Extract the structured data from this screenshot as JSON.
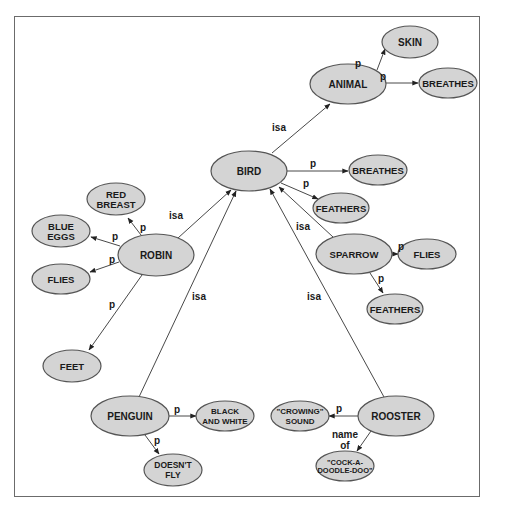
{
  "diagram": {
    "title": "",
    "type": "semantic-network",
    "colors": {
      "node_fill": "#d4d4d4",
      "node_stroke": "#555555",
      "edge": "#333333",
      "frame": "#6b6b6b"
    },
    "nodes": [
      {
        "id": "animal",
        "lines": [
          "ANIMAL"
        ],
        "cx": 348,
        "cy": 84,
        "rx": 38,
        "ry": 20,
        "fs": 10
      },
      {
        "id": "skin",
        "lines": [
          "SKIN"
        ],
        "cx": 410,
        "cy": 42,
        "rx": 28,
        "ry": 16,
        "fs": 10
      },
      {
        "id": "animal-breathes",
        "lines": [
          "BREATHES"
        ],
        "cx": 448,
        "cy": 83,
        "rx": 29,
        "ry": 15,
        "fs": 9.5
      },
      {
        "id": "bird",
        "lines": [
          "BIRD"
        ],
        "cx": 249,
        "cy": 171,
        "rx": 38,
        "ry": 20,
        "fs": 10
      },
      {
        "id": "bird-breathes",
        "lines": [
          "BREATHES"
        ],
        "cx": 378,
        "cy": 170,
        "rx": 29,
        "ry": 15,
        "fs": 9.5
      },
      {
        "id": "bird-feathers",
        "lines": [
          "FEATHERS"
        ],
        "cx": 341,
        "cy": 208,
        "rx": 28,
        "ry": 15,
        "fs": 9.5
      },
      {
        "id": "red-breast",
        "lines": [
          "RED",
          "BREAST"
        ],
        "cx": 116,
        "cy": 199,
        "rx": 29,
        "ry": 16,
        "fs": 9.5
      },
      {
        "id": "blue-eggs",
        "lines": [
          "BLUE",
          "EGGS"
        ],
        "cx": 61,
        "cy": 231,
        "rx": 29,
        "ry": 16,
        "fs": 9.5
      },
      {
        "id": "robin",
        "lines": [
          "ROBIN"
        ],
        "cx": 156,
        "cy": 255,
        "rx": 38,
        "ry": 21,
        "fs": 10
      },
      {
        "id": "robin-flies",
        "lines": [
          "FLIES"
        ],
        "cx": 61,
        "cy": 279,
        "rx": 29,
        "ry": 15,
        "fs": 9.5
      },
      {
        "id": "feet",
        "lines": [
          "FEET"
        ],
        "cx": 72,
        "cy": 366,
        "rx": 29,
        "ry": 16,
        "fs": 9.5
      },
      {
        "id": "sparrow",
        "lines": [
          "SPARROW"
        ],
        "cx": 354,
        "cy": 254,
        "rx": 38,
        "ry": 20,
        "fs": 9.5
      },
      {
        "id": "sparrow-flies",
        "lines": [
          "FLIES"
        ],
        "cx": 427,
        "cy": 254,
        "rx": 29,
        "ry": 15,
        "fs": 9.5
      },
      {
        "id": "sparrow-feathers",
        "lines": [
          "FEATHERS"
        ],
        "cx": 395,
        "cy": 309,
        "rx": 28,
        "ry": 15,
        "fs": 9.5
      },
      {
        "id": "penguin",
        "lines": [
          "PENGUIN"
        ],
        "cx": 130,
        "cy": 416,
        "rx": 39,
        "ry": 20,
        "fs": 10
      },
      {
        "id": "black-and-white",
        "lines": [
          "BLACK",
          "AND WHITE"
        ],
        "cx": 225,
        "cy": 416,
        "rx": 29,
        "ry": 15,
        "fs": 8
      },
      {
        "id": "doesnt-fly",
        "lines": [
          "DOESN'T",
          "FLY"
        ],
        "cx": 173,
        "cy": 470,
        "rx": 29,
        "ry": 16,
        "fs": 8.5
      },
      {
        "id": "rooster",
        "lines": [
          "ROOSTER"
        ],
        "cx": 396,
        "cy": 416,
        "rx": 38,
        "ry": 20,
        "fs": 10
      },
      {
        "id": "crowing-sound",
        "lines": [
          "\"CROWING\"",
          "SOUND"
        ],
        "cx": 300,
        "cy": 416,
        "rx": 29,
        "ry": 15,
        "fs": 8
      },
      {
        "id": "cock-a-doodle-doo",
        "lines": [
          "\"COCK-A-",
          "DOODLE-DOO\""
        ],
        "cx": 345,
        "cy": 466,
        "rx": 29,
        "ry": 15,
        "fs": 7.5
      }
    ],
    "edges": [
      {
        "from": "bird",
        "to": "animal",
        "label": "isa",
        "x1": 272,
        "y1": 153,
        "x2": 330,
        "y2": 104,
        "lx": 279,
        "ly": 127
      },
      {
        "from": "animal",
        "to": "skin",
        "label": "p",
        "x1": 377,
        "y1": 70,
        "x2": 385,
        "y2": 49,
        "lx": 358,
        "ly": 63,
        "curve": false
      },
      {
        "from": "animal",
        "to": "animal-breathes",
        "label": "p",
        "x1": 386,
        "y1": 83,
        "x2": 418,
        "y2": 83,
        "lx": 383,
        "ly": 76
      },
      {
        "from": "bird",
        "to": "bird-breathes",
        "label": "p",
        "x1": 287,
        "y1": 171,
        "x2": 348,
        "y2": 171,
        "lx": 313,
        "ly": 163
      },
      {
        "from": "bird",
        "to": "bird-feathers",
        "label": "p",
        "x1": 281,
        "y1": 183,
        "x2": 318,
        "y2": 199,
        "lx": 306,
        "ly": 183
      },
      {
        "from": "robin",
        "to": "bird",
        "label": "isa",
        "x1": 178,
        "y1": 238,
        "x2": 231,
        "y2": 190,
        "lx": 176,
        "ly": 215
      },
      {
        "from": "robin",
        "to": "red-breast",
        "label": "p",
        "x1": 141,
        "y1": 235,
        "x2": 128,
        "y2": 218,
        "lx": 143,
        "ly": 227
      },
      {
        "from": "robin",
        "to": "blue-eggs",
        "label": "p",
        "x1": 120,
        "y1": 246,
        "x2": 91,
        "y2": 237,
        "lx": 115,
        "ly": 236
      },
      {
        "from": "robin",
        "to": "robin-flies",
        "label": "p",
        "x1": 119,
        "y1": 262,
        "x2": 90,
        "y2": 272,
        "lx": 112,
        "ly": 259
      },
      {
        "from": "robin",
        "to": "feet",
        "label": "p",
        "x1": 142,
        "y1": 275,
        "x2": 89,
        "y2": 350,
        "lx": 112,
        "ly": 304
      },
      {
        "from": "penguin",
        "to": "bird",
        "label": "isa",
        "x1": 139,
        "y1": 397,
        "x2": 236,
        "y2": 191,
        "lx": 199,
        "ly": 296
      },
      {
        "from": "penguin",
        "to": "black-and-white",
        "label": "p",
        "x1": 169,
        "y1": 416,
        "x2": 196,
        "y2": 416,
        "lx": 177,
        "ly": 409
      },
      {
        "from": "penguin",
        "to": "doesnt-fly",
        "label": "p",
        "x1": 145,
        "y1": 435,
        "x2": 159,
        "y2": 454,
        "lx": 157,
        "ly": 440
      },
      {
        "from": "sparrow",
        "to": "bird",
        "label": "isa",
        "x1": 333,
        "y1": 237,
        "x2": 279,
        "y2": 187,
        "lx": 303,
        "ly": 226
      },
      {
        "from": "sparrow",
        "to": "sparrow-flies",
        "label": "p",
        "x1": 392,
        "y1": 254,
        "x2": 398,
        "y2": 254,
        "lx": 401,
        "ly": 246
      },
      {
        "from": "sparrow",
        "to": "sparrow-feathers",
        "label": "p",
        "x1": 370,
        "y1": 273,
        "x2": 383,
        "y2": 293,
        "lx": 381,
        "ly": 278
      },
      {
        "from": "rooster",
        "to": "bird",
        "label": "isa",
        "x1": 384,
        "y1": 397,
        "x2": 270,
        "y2": 189,
        "lx": 314,
        "ly": 296
      },
      {
        "from": "rooster",
        "to": "crowing-sound",
        "label": "p",
        "x1": 358,
        "y1": 416,
        "x2": 329,
        "y2": 416,
        "lx": 339,
        "ly": 408
      },
      {
        "from": "rooster",
        "to": "cock-a-doodle-doo",
        "label": "name of",
        "label_lines": [
          "name",
          "of"
        ],
        "x1": 371,
        "y1": 431,
        "x2": 357,
        "y2": 451,
        "lx": 345,
        "ly": 439
      }
    ]
  }
}
